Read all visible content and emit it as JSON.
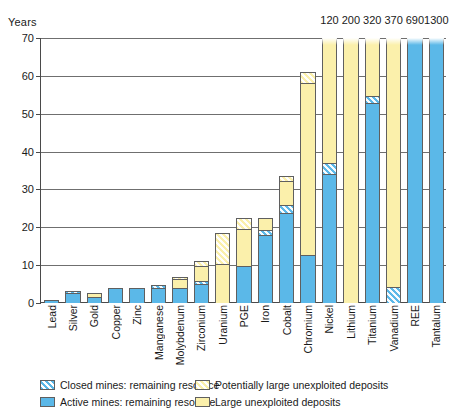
{
  "chart_data": {
    "type": "bar",
    "title": "",
    "subtitle": "",
    "xlabel": "",
    "ylabel": "Years",
    "ylim": [
      0,
      70
    ],
    "ytick_labels": [
      "0",
      "10",
      "20",
      "30",
      "40",
      "50",
      "60",
      "70"
    ],
    "ytick_values": [
      0,
      10,
      20,
      30,
      40,
      50,
      60,
      70
    ],
    "grid": true,
    "stacked": true,
    "legend_position": "bottom",
    "categories": [
      "Lead",
      "Silver",
      "Gold",
      "Copper",
      "Zinc",
      "Manganese",
      "Molybdenum",
      "Zirconium",
      "Uranium",
      "PGE",
      "Iron",
      "Cobalt",
      "Chromium",
      "Nickel",
      "Lithium",
      "Titanium",
      "Vanadium",
      "REE",
      "Tantalum"
    ],
    "series": [
      {
        "name": "Active mines: remaining resource",
        "key": "active",
        "color": "#5bb8e8",
        "hatched": false,
        "values": [
          0.7,
          2.6,
          1.7,
          3.9,
          4.0,
          3.9,
          4.0,
          5.0,
          0.0,
          9.8,
          18.0,
          23.8,
          12.6,
          34.0,
          0.0,
          52.8,
          0.0,
          70,
          70
        ]
      },
      {
        "name": "Closed mines: remaining resource",
        "key": "closed",
        "color": "#5bb8e8",
        "hatched": true,
        "values": [
          0.0,
          0.5,
          0.0,
          0.0,
          0.0,
          0.8,
          0.0,
          0.9,
          0.0,
          0.0,
          1.3,
          2.1,
          0.0,
          3.0,
          0.0,
          2.0,
          4.2,
          0.0,
          0.0
        ]
      },
      {
        "name": "Large unexploited deposits",
        "key": "large",
        "color": "#fbf0ab",
        "hatched": false,
        "values": [
          0.0,
          0.0,
          1.0,
          0.0,
          0.0,
          0.0,
          2.4,
          3.8,
          10.3,
          9.7,
          3.2,
          6.3,
          45.6,
          33.0,
          70,
          15.2,
          65.8,
          0.0,
          0.0
        ]
      },
      {
        "name": "Potentially large unexploited deposits",
        "key": "potential",
        "color": "#fbf0ab",
        "hatched": true,
        "values": [
          0.0,
          0.0,
          0.0,
          0.0,
          0.0,
          0.0,
          0.6,
          1.3,
          8.2,
          3.0,
          0.0,
          1.3,
          2.8,
          0.0,
          0.0,
          0.0,
          0.0,
          0.0,
          0.0
        ]
      }
    ],
    "totals": [
      0.7,
      3.1,
      2.7,
      3.9,
      4.0,
      4.7,
      7.0,
      11.0,
      18.5,
      22.5,
      22.5,
      33.5,
      61.0,
      70,
      70,
      70,
      70,
      70,
      70
    ],
    "clipped_categories": [
      "Nickel",
      "Lithium",
      "Titanium",
      "Vanadium",
      "REE",
      "Tantalum"
    ],
    "top_value_labels": [
      {
        "category": "Nickel",
        "value": "120"
      },
      {
        "category": "Lithium",
        "value": "200"
      },
      {
        "category": "Titanium",
        "value": "320"
      },
      {
        "category": "Vanadium",
        "value": "370"
      },
      {
        "category": "REE",
        "value": "690"
      },
      {
        "category": "Tantalum",
        "value": "1300"
      }
    ],
    "legend": [
      {
        "label": "Closed mines: remaining resource",
        "key": "closed",
        "color": "#5bb8e8",
        "hatched": true,
        "column": 1
      },
      {
        "label": "Active mines: remaining resource",
        "key": "active",
        "color": "#5bb8e8",
        "hatched": false,
        "column": 1
      },
      {
        "label": "Potentially large unexploited deposits",
        "key": "potential",
        "color": "#fbf0ab",
        "hatched": true,
        "column": 2
      },
      {
        "label": "Large unexploited deposits",
        "key": "large",
        "color": "#fbf0ab",
        "hatched": false,
        "column": 2
      }
    ],
    "colors": {
      "blue": "#5bb8e8",
      "yellow": "#fbf0ab",
      "axis": "#4a4a4a",
      "grid": "#6f6f6f",
      "outline": "#5f5f5f",
      "text": "#1a1a1a",
      "background": "#ffffff"
    }
  }
}
